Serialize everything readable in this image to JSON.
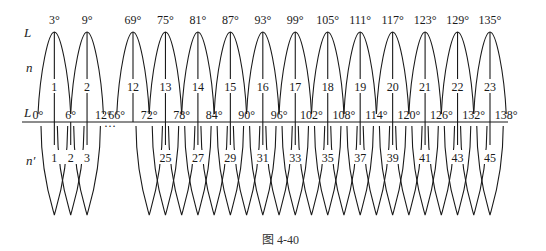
{
  "figure": {
    "caption": "图 4-40",
    "row_labels": {
      "top_L": "L",
      "n": "n",
      "mid_L": "L",
      "n_prime": "n′"
    },
    "ellipsis": "…",
    "peak_L": [
      {
        "deg": 3,
        "label": "3°",
        "n": "1"
      },
      {
        "deg": 9,
        "label": "9°",
        "n": "2"
      },
      {
        "deg": 69,
        "label": "69°",
        "n": "12"
      },
      {
        "deg": 75,
        "label": "75°",
        "n": "13"
      },
      {
        "deg": 81,
        "label": "81°",
        "n": "14"
      },
      {
        "deg": 87,
        "label": "87°",
        "n": "15"
      },
      {
        "deg": 93,
        "label": "93°",
        "n": "16"
      },
      {
        "deg": 99,
        "label": "99°",
        "n": "17"
      },
      {
        "deg": 105,
        "label": "105°",
        "n": "18"
      },
      {
        "deg": 111,
        "label": "111°",
        "n": "19"
      },
      {
        "deg": 117,
        "label": "117°",
        "n": "20"
      },
      {
        "deg": 123,
        "label": "123°",
        "n": "21"
      },
      {
        "deg": 129,
        "label": "129°",
        "n": "22"
      },
      {
        "deg": 135,
        "label": "135°",
        "n": "23"
      }
    ],
    "valley_L": [
      {
        "deg": 0,
        "label": "0°"
      },
      {
        "deg": 6,
        "label": "6°"
      },
      {
        "deg": 12,
        "label": "12°"
      },
      {
        "deg": 66,
        "label": "66°"
      },
      {
        "deg": 72,
        "label": "72°"
      },
      {
        "deg": 78,
        "label": "78°"
      },
      {
        "deg": 84,
        "label": "84°"
      },
      {
        "deg": 90,
        "label": "90°"
      },
      {
        "deg": 96,
        "label": "96°"
      },
      {
        "deg": 102,
        "label": "102°"
      },
      {
        "deg": 108,
        "label": "108°"
      },
      {
        "deg": 114,
        "label": "114°"
      },
      {
        "deg": 120,
        "label": "120°"
      },
      {
        "deg": 126,
        "label": "126°"
      },
      {
        "deg": 132,
        "label": "132°"
      },
      {
        "deg": 138,
        "label": "138°"
      }
    ],
    "n_prime_left": [
      {
        "deg": 3,
        "label": "1"
      },
      {
        "deg": 6,
        "label": "2"
      },
      {
        "deg": 9,
        "label": "3"
      }
    ],
    "n_prime_right": [
      {
        "deg": 75,
        "label": "25"
      },
      {
        "deg": 81,
        "label": "27"
      },
      {
        "deg": 87,
        "label": "29"
      },
      {
        "deg": 93,
        "label": "31"
      },
      {
        "deg": 99,
        "label": "33"
      },
      {
        "deg": 105,
        "label": "35"
      },
      {
        "deg": 111,
        "label": "37"
      },
      {
        "deg": 117,
        "label": "39"
      },
      {
        "deg": 123,
        "label": "41"
      },
      {
        "deg": 129,
        "label": "43"
      },
      {
        "deg": 135,
        "label": "45"
      }
    ]
  }
}
